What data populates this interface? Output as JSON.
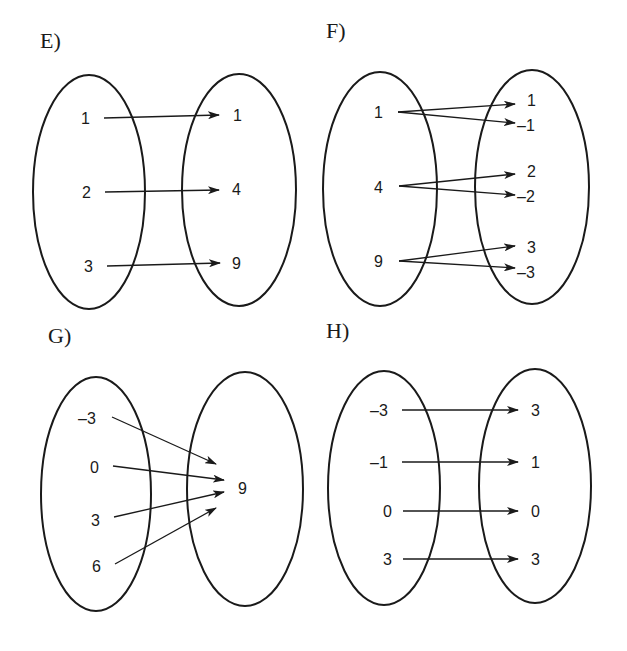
{
  "panels": [
    {
      "label": "E)",
      "domain": [
        "1",
        "2",
        "3"
      ],
      "range": [
        "1",
        "4",
        "9"
      ],
      "mappings": [
        [
          "1",
          "1"
        ],
        [
          "2",
          "4"
        ],
        [
          "3",
          "9"
        ]
      ]
    },
    {
      "label": "F)",
      "domain": [
        "1",
        "4",
        "9"
      ],
      "range": [
        "1",
        "–1",
        "2",
        "–2",
        "3",
        "–3"
      ],
      "mappings": [
        [
          "1",
          "1"
        ],
        [
          "1",
          "–1"
        ],
        [
          "4",
          "2"
        ],
        [
          "4",
          "–2"
        ],
        [
          "9",
          "3"
        ],
        [
          "9",
          "–3"
        ]
      ]
    },
    {
      "label": "G)",
      "domain": [
        "–3",
        "0",
        "3",
        "6"
      ],
      "range": [
        "9"
      ],
      "mappings": [
        [
          "–3",
          "9"
        ],
        [
          "0",
          "9"
        ],
        [
          "3",
          "9"
        ],
        [
          "6",
          "9"
        ]
      ]
    },
    {
      "label": "H)",
      "domain": [
        "–3",
        "–1",
        "0",
        "3"
      ],
      "range": [
        "3",
        "1",
        "0",
        "3"
      ],
      "mappings": [
        [
          "–3",
          "3"
        ],
        [
          "–1",
          "1"
        ],
        [
          "0",
          "0"
        ],
        [
          "3",
          "3"
        ]
      ]
    }
  ],
  "colors": {
    "stroke": "#1a1a1a",
    "background": "#ffffff"
  }
}
